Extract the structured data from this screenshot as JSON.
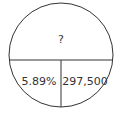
{
  "diagram": {
    "type": "formula-circle",
    "top": "?",
    "bottom_left": "5.89%",
    "bottom_right": "297,500",
    "line_color": "#333333"
  }
}
